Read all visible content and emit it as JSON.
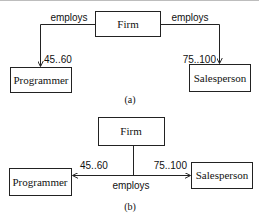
{
  "diagram_a": {
    "caption": "(a)",
    "classes": {
      "firm": "Firm",
      "programmer": "Programmer",
      "salesperson": "Salesperson"
    },
    "relations": [
      {
        "from": "Firm",
        "to": "Programmer",
        "label": "employs",
        "multiplicity": "45..60"
      },
      {
        "from": "Firm",
        "to": "Salesperson",
        "label": "employs",
        "multiplicity": "75..100"
      }
    ]
  },
  "diagram_b": {
    "caption": "(b)",
    "classes": {
      "firm": "Firm",
      "programmer": "Programmer",
      "salesperson": "Salesperson"
    },
    "relation": {
      "label": "employs",
      "left_multiplicity": "45..60",
      "right_multiplicity": "75..100"
    }
  },
  "colors": {
    "line": "#222222",
    "background": "#ffffff"
  }
}
